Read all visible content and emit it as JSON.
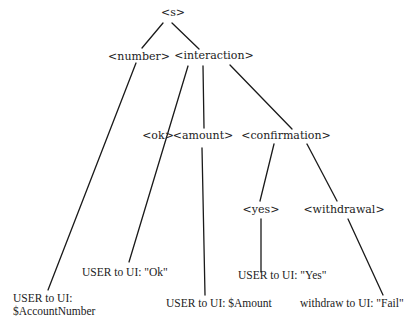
{
  "diagram": {
    "type": "parse-tree",
    "nodes": {
      "s": "<s>",
      "number": "<number>",
      "interaction": "<interaction>",
      "ok": "<ok>",
      "amount": "<amount>",
      "confirmation": "<confirmation>",
      "yes": "<yes>",
      "withdrawal": "<withdrawal>"
    },
    "leaves": {
      "account_line1": "USER to UI:",
      "account_line2": "$AccountNumber",
      "ok": "USER to UI: \"Ok\"",
      "amount": "USER to UI: $Amount",
      "yes": "USER to UI: \"Yes\"",
      "withdrawal": "withdraw to UI: \"Fail\""
    },
    "edges": [
      [
        "<s>",
        "<number>"
      ],
      [
        "<s>",
        "<interaction>"
      ],
      [
        "<number>",
        "USER to UI: $AccountNumber"
      ],
      [
        "<interaction>",
        "<ok>"
      ],
      [
        "<interaction>",
        "<amount>"
      ],
      [
        "<interaction>",
        "<confirmation>"
      ],
      [
        "<ok>",
        "USER to UI: \"Ok\""
      ],
      [
        "<amount>",
        "USER to UI: $Amount"
      ],
      [
        "<confirmation>",
        "<yes>"
      ],
      [
        "<confirmation>",
        "<withdrawal>"
      ],
      [
        "<yes>",
        "USER to UI: \"Yes\""
      ],
      [
        "<withdrawal>",
        "withdraw to UI: \"Fail\""
      ]
    ]
  }
}
